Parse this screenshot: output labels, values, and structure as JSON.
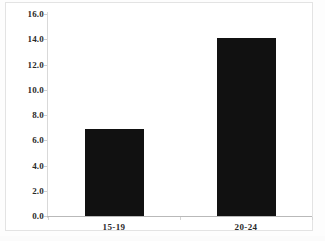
{
  "chart_data": {
    "type": "bar",
    "title": "",
    "subtitle": "",
    "xlabel": "",
    "ylabel": "",
    "categories": [
      "15-19",
      "20-24"
    ],
    "values": [
      6.9,
      14.1
    ],
    "series": [
      {
        "name": "",
        "values": [
          6.9,
          14.1
        ]
      }
    ],
    "ylim": [
      0.0,
      16.0
    ],
    "ytick_step": 2.0,
    "ytick_labels": [
      "0.0",
      "2.0",
      "4.0",
      "6.0",
      "8.0",
      "10.0",
      "12.0",
      "14.0",
      "16.0"
    ],
    "ytick_values": [
      0.0,
      2.0,
      4.0,
      6.0,
      8.0,
      10.0,
      12.0,
      14.0,
      16.0
    ],
    "grid": false,
    "legend": null,
    "legend_position": "none",
    "annotations": [],
    "colors": {
      "bar": "#111111",
      "axis": "#b9b9b9",
      "tick_text": "#2a2a2a",
      "frame": "#e3e3e3",
      "plot_background": "#ffffff",
      "page_background": "#fdfdfd"
    }
  }
}
